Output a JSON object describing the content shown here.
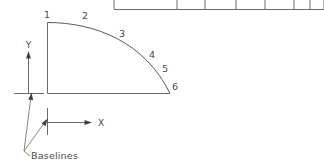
{
  "figure": {
    "line_color": "#5a5a5a",
    "background_color": "#ffffff"
  },
  "table": {
    "name": "top-table",
    "row_count": 1,
    "column_count": 7,
    "cells": [
      "",
      "",
      "",
      "",
      "",
      "",
      ""
    ]
  },
  "axes": {
    "y": {
      "label": "Y",
      "direction": "up"
    },
    "x": {
      "label": "X",
      "direction": "right"
    }
  },
  "annotation": {
    "label": "Baselines",
    "leader_count": 2
  },
  "shape": {
    "name": "quarter-curve-profile",
    "point_labels": [
      "1",
      "2",
      "3",
      "4",
      "5",
      "6"
    ]
  }
}
